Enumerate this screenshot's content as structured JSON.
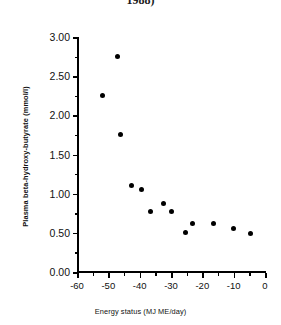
{
  "figure": {
    "caption_fragment": "1988)"
  },
  "chart_data": {
    "type": "scatter",
    "title": "",
    "subtitle": "",
    "xlabel": "Energy status (MJ ME/day)",
    "ylabel": "Plasma beta-hydroxy-butyrate (mmol/l)",
    "xlim": [
      -60,
      0
    ],
    "ylim": [
      0.0,
      3.0
    ],
    "grid": false,
    "legend": null,
    "legend_position": "none",
    "marker": "filled-circle",
    "marker_color": "#000000",
    "xticks": [
      -60,
      -50,
      -40,
      -30,
      -20,
      -10,
      0
    ],
    "xticklabels": [
      "-60",
      "-50",
      "-40",
      "-30",
      "-20",
      "-10",
      "0"
    ],
    "x_minor_tick_interval": 5,
    "yticks": [
      0.0,
      0.5,
      1.0,
      1.5,
      2.0,
      2.5,
      3.0
    ],
    "yticklabels": [
      "0.00",
      "0.50",
      "1.00",
      "1.50",
      "2.00",
      "2.50",
      "3.00"
    ],
    "y_minor_tick_interval": 0.25,
    "n_points": 13,
    "points": [
      {
        "x": -52.0,
        "y": 2.25
      },
      {
        "x": -47.0,
        "y": 2.75
      },
      {
        "x": -46.0,
        "y": 1.76
      },
      {
        "x": -42.5,
        "y": 1.11
      },
      {
        "x": -39.5,
        "y": 1.05
      },
      {
        "x": -36.5,
        "y": 0.77
      },
      {
        "x": -32.5,
        "y": 0.87
      },
      {
        "x": -30.0,
        "y": 0.77
      },
      {
        "x": -25.5,
        "y": 0.51
      },
      {
        "x": -23.0,
        "y": 0.62
      },
      {
        "x": -16.5,
        "y": 0.62
      },
      {
        "x": -10.0,
        "y": 0.55
      },
      {
        "x": -4.5,
        "y": 0.49
      }
    ]
  }
}
